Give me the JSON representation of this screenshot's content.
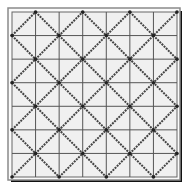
{
  "diagram": {
    "type": "diamond-lattice-grid",
    "grid": {
      "rows": 7,
      "cols": 7
    },
    "colors": {
      "background": "#ffffff",
      "cell_fill": "#f0f0f0",
      "grid_line": "#555555",
      "outer_frame": "#8a8a8a",
      "shadow": "#111111",
      "diagonal": "#444444"
    },
    "diagonal_sums": [
      1,
      3,
      5,
      7,
      9,
      11,
      13
    ],
    "diagonal_diffs": [
      -5,
      -3,
      -1,
      1,
      3,
      5
    ]
  }
}
